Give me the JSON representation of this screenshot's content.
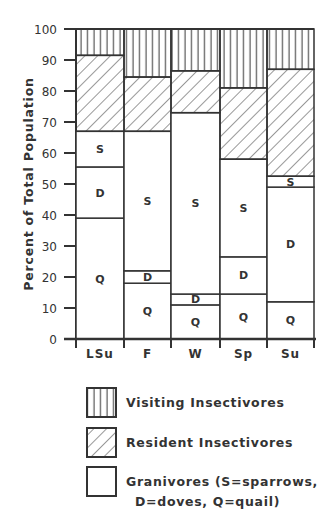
{
  "chart_data": {
    "type": "bar",
    "stacked": true,
    "title": "",
    "xlabel": "",
    "ylabel": "Percent of Total Population",
    "ylim": [
      0,
      100
    ],
    "yticks": [
      0,
      10,
      20,
      30,
      40,
      50,
      60,
      70,
      80,
      90,
      100
    ],
    "grid": false,
    "categories": [
      "LSu",
      "F",
      "W",
      "Sp",
      "Su"
    ],
    "series": [
      {
        "name": "Granivores - Quail",
        "code": "Q",
        "pattern": "blank",
        "values": [
          39,
          18,
          11,
          14.5,
          12
        ]
      },
      {
        "name": "Granivores - Doves",
        "code": "D",
        "pattern": "blank",
        "values": [
          16.5,
          4,
          3.5,
          12,
          37
        ]
      },
      {
        "name": "Granivores - Sparrows",
        "code": "S",
        "pattern": "blank",
        "values": [
          11.5,
          45,
          58.5,
          31.5,
          3.5
        ]
      },
      {
        "name": "Resident Insectivores",
        "code": "",
        "pattern": "diagonal",
        "values": [
          24.5,
          17.5,
          13.5,
          23,
          34.5
        ]
      },
      {
        "name": "Visiting Insectivores",
        "code": "",
        "pattern": "vertical",
        "values": [
          8.5,
          15.5,
          13.5,
          19,
          13
        ]
      }
    ],
    "legend": {
      "position": "bottom",
      "entries": [
        {
          "label": "Visiting Insectivores",
          "pattern": "vertical"
        },
        {
          "label": "Resident Insectivores",
          "pattern": "diagonal"
        },
        {
          "label_line1": "Granivores (S=sparrows,",
          "label_line2": "D=doves, Q=quail)",
          "pattern": "blank"
        }
      ]
    }
  },
  "colors": {
    "ink": "#333333",
    "background": "#ffffff"
  }
}
